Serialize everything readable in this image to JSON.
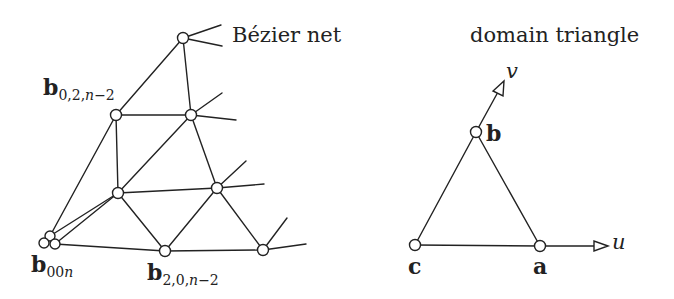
{
  "figure": {
    "left_title": "Bézier net",
    "right_title": "domain triangle",
    "bezier_labels": {
      "b02": {
        "base": "b",
        "sub_a": "0,2,",
        "sub_n": "n",
        "sub_b": "−2"
      },
      "b00n": {
        "base": "b",
        "sub_a": "00",
        "sub_n": "n",
        "sub_b": ""
      },
      "b20": {
        "base": "b",
        "sub_a": "2,0,",
        "sub_n": "n",
        "sub_b": "−2"
      }
    },
    "domain_labels": {
      "a": "a",
      "b": "b",
      "c": "c",
      "u": "u",
      "v": "v"
    },
    "colors": {
      "stroke": "#222222",
      "background": "#ffffff"
    }
  }
}
